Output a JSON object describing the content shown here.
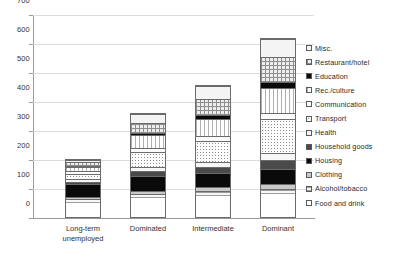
{
  "chart_data": {
    "type": "bar",
    "subtype": "stacked-column",
    "title": "",
    "xlabel": "",
    "ylabel": "",
    "ylim": [
      0,
      700
    ],
    "ytick_step": 100,
    "yticks": [
      0,
      100,
      200,
      300,
      400,
      500,
      600,
      700
    ],
    "grid": true,
    "legend_position": "right",
    "categories": [
      "Long-term unemployed",
      "Dominated",
      "Intermediate",
      "Dominant"
    ],
    "category_lines": [
      [
        "Long-term",
        "unemployed"
      ],
      [
        "Dominated"
      ],
      [
        "Intermediate"
      ],
      [
        "Dominant"
      ]
    ],
    "stack_order_bottom_to_top": [
      "Food and drink",
      "Alcohol/tobacco",
      "Clothing",
      "Housing",
      "Household goods",
      "Health",
      "Transport",
      "Communication",
      "Rec./culture",
      "Education",
      "Restaurant/hotel",
      "Misc."
    ],
    "series": [
      {
        "name": "Food and drink",
        "fill": "f-white",
        "values": [
          52,
          68,
          74,
          80
        ]
      },
      {
        "name": "Alcohol/tobacco",
        "fill": "f-lighthatch",
        "values": [
          13,
          14,
          16,
          17
        ]
      },
      {
        "name": "Clothing",
        "fill": "f-grayfill",
        "values": [
          8,
          10,
          14,
          18
        ]
      },
      {
        "name": "Housing",
        "fill": "f-black",
        "values": [
          44,
          52,
          50,
          54
        ]
      },
      {
        "name": "Household goods",
        "fill": "f-darkgray",
        "values": [
          10,
          18,
          22,
          30
        ]
      },
      {
        "name": "Health",
        "fill": "f-lightdots",
        "values": [
          8,
          14,
          18,
          26
        ]
      },
      {
        "name": "Transport",
        "fill": "f-dots",
        "values": [
          18,
          52,
          72,
          116
        ]
      },
      {
        "name": "Communication",
        "fill": "f-offwhite",
        "values": [
          12,
          16,
          18,
          22
        ]
      },
      {
        "name": "Rec./culture",
        "fill": "f-vhatch",
        "values": [
          14,
          44,
          58,
          86
        ]
      },
      {
        "name": "Education",
        "fill": "f-black",
        "values": [
          4,
          6,
          14,
          22
        ]
      },
      {
        "name": "Restaurant/hotel",
        "fill": "f-crosshatch",
        "values": [
          12,
          36,
          56,
          86
        ]
      },
      {
        "name": "Misc.",
        "fill": "f-palegray",
        "values": [
          10,
          32,
          48,
          63
        ]
      }
    ],
    "totals": [
      205,
      362,
      460,
      620
    ]
  },
  "legend": {
    "items": [
      {
        "label": "Misc.",
        "fill": "f-palegray"
      },
      {
        "label": "Restaurant/hotel",
        "fill": "f-crosshatch"
      },
      {
        "label": "Education",
        "fill": "f-black"
      },
      {
        "label": "Rec./culture",
        "fill": "f-vhatch"
      },
      {
        "label": "Communication",
        "fill": "f-offwhite"
      },
      {
        "label": "Transport",
        "fill": "f-dots"
      },
      {
        "label": "Health",
        "fill": "f-lightdots"
      },
      {
        "label": "Household goods",
        "fill": "f-darkgray"
      },
      {
        "label": "Housing",
        "fill": "f-black"
      },
      {
        "label": "Clothing",
        "fill": "f-grayfill"
      },
      {
        "label": "Alcohol/tobacco",
        "fill": "f-lighthatch"
      },
      {
        "label": "Food and drink",
        "fill": "f-white"
      }
    ]
  },
  "colors": {
    "gridline": "#dcdcdc",
    "axis": "#9a9a9a",
    "bar_outline": "#6b6b6b",
    "text": "#2b2b2b",
    "background": "#ffffff"
  }
}
